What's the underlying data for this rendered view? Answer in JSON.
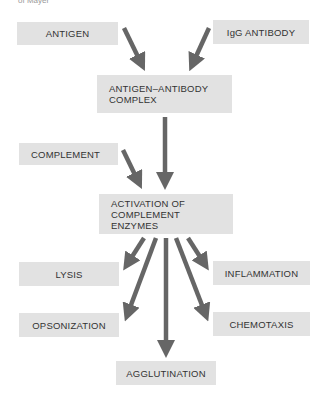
{
  "caption": "of Mayer",
  "colors": {
    "box_fill": "#e2e2e2",
    "arrow": "#666666",
    "text": "#333333"
  },
  "nodes": {
    "antigen": "ANTIGEN",
    "igg_antibody": "IgG ANTIBODY",
    "complex": "ANTIGEN–ANTIBODY\nCOMPLEX",
    "complement": "COMPLEMENT",
    "activation": "ACTIVATION OF\nCOMPLEMENT\nENZYMES",
    "lysis": "LYSIS",
    "inflammation": "INFLAMMATION",
    "opsonization": "OPSONIZATION",
    "chemotaxis": "CHEMOTAXIS",
    "agglutination": "AGGLUTINATION"
  },
  "edges": [
    {
      "from": "antigen",
      "to": "complex"
    },
    {
      "from": "igg_antibody",
      "to": "complex"
    },
    {
      "from": "complex",
      "to": "activation"
    },
    {
      "from": "complement",
      "to": "activation"
    },
    {
      "from": "activation",
      "to": "lysis"
    },
    {
      "from": "activation",
      "to": "opsonization"
    },
    {
      "from": "activation",
      "to": "agglutination"
    },
    {
      "from": "activation",
      "to": "chemotaxis"
    },
    {
      "from": "activation",
      "to": "inflammation"
    }
  ]
}
